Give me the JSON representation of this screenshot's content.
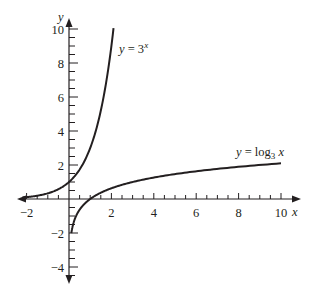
{
  "chart_data": {
    "type": "line",
    "title": "",
    "xlabel": "x",
    "ylabel": "y",
    "xlim": [
      -2.4,
      10.9
    ],
    "ylim": [
      -4.9,
      10.6
    ],
    "x_ticks_labeled": [
      -2,
      2,
      4,
      6,
      8,
      10
    ],
    "x_tick_labels": [
      "−2",
      "2",
      "4",
      "6",
      "8",
      "10"
    ],
    "y_ticks_labeled": [
      -4,
      -2,
      2,
      4,
      6,
      8,
      10
    ],
    "y_tick_labels": [
      "−4",
      "−2",
      "2",
      "4",
      "6",
      "8",
      "10"
    ],
    "minor_tick_step": 0.5,
    "grid": false,
    "legend": "none (inline labels)",
    "series": [
      {
        "name": "y = 3^x",
        "label_text": "y = 3",
        "label_sup": "x",
        "function": "3^x",
        "domain": [
          -2.2,
          2.1
        ],
        "x": [
          -2,
          -1,
          0,
          1,
          2
        ],
        "y": [
          0.11,
          0.33,
          1,
          3,
          9
        ]
      },
      {
        "name": "y = log_3 x",
        "label_text": "y = log",
        "label_sub": "3",
        "label_var": " x",
        "function": "log3(x)",
        "domain": [
          0.11,
          10
        ],
        "x": [
          0.11,
          0.33,
          1,
          3,
          9,
          10
        ],
        "y": [
          -2,
          -1,
          0,
          1,
          2,
          2.1
        ]
      }
    ],
    "annotations": [
      {
        "text": "y = 3^x",
        "near": [
          2.5,
          8.7
        ]
      },
      {
        "text": "y = log_3 x",
        "near": [
          8.8,
          2.7
        ]
      }
    ]
  }
}
